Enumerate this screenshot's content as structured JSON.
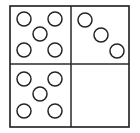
{
  "figure": {
    "width": 140,
    "height": 133,
    "background_color": "#ffffff",
    "border_color": "#1c1c1c",
    "divider_color": "#2a2a2a",
    "circle_fill": "#ffffff",
    "circle_stroke": "#242424",
    "circle_radius": 7,
    "frame": {
      "left": 10,
      "top": 6,
      "right": 129,
      "bottom": 127,
      "divider_x": 71,
      "divider_y": 64
    }
  },
  "quadrants": [
    {
      "id": "top-left",
      "label": "Top left group",
      "count": 5,
      "arrangement": "quincunx",
      "circles": [
        {
          "cx": 24,
          "cy": 19
        },
        {
          "cx": 55,
          "cy": 19
        },
        {
          "cx": 40,
          "cy": 34
        },
        {
          "cx": 24,
          "cy": 50
        },
        {
          "cx": 55,
          "cy": 50
        }
      ]
    },
    {
      "id": "top-right",
      "label": "Top right group",
      "count": 3,
      "arrangement": "diagonal",
      "circles": [
        {
          "cx": 85,
          "cy": 20
        },
        {
          "cx": 101,
          "cy": 35
        },
        {
          "cx": 117,
          "cy": 51
        }
      ]
    },
    {
      "id": "bottom-left",
      "label": "Bottom left group",
      "count": 5,
      "arrangement": "quincunx",
      "circles": [
        {
          "cx": 24,
          "cy": 79
        },
        {
          "cx": 55,
          "cy": 79
        },
        {
          "cx": 40,
          "cy": 94
        },
        {
          "cx": 24,
          "cy": 111
        },
        {
          "cx": 55,
          "cy": 111
        }
      ]
    },
    {
      "id": "bottom-right",
      "label": "Bottom right group",
      "count": 0,
      "arrangement": "empty",
      "circles": []
    }
  ],
  "chart_data": {
    "type": "table",
    "categories": [
      "Top left",
      "Top right",
      "Bottom left",
      "Bottom right"
    ],
    "values": [
      5,
      3,
      5,
      0
    ],
    "xlabel": "Quadrant",
    "ylabel": "Number of circles"
  }
}
